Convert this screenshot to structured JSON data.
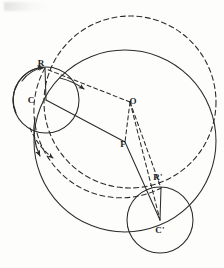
{
  "figure": {
    "background_color": "#fdfdfb",
    "stroke_color": "#2b2b2b",
    "labels": [
      {
        "id": "R",
        "text": "R",
        "x": 41,
        "y": 66,
        "anchor": "middle",
        "role": "point-label"
      },
      {
        "id": "C",
        "text": "C",
        "x": 31,
        "y": 103,
        "anchor": "middle",
        "role": "point-label"
      },
      {
        "id": "O",
        "text": "O",
        "x": 133,
        "y": 104,
        "anchor": "middle",
        "role": "point-label"
      },
      {
        "id": "F",
        "text": "F",
        "x": 123,
        "y": 147,
        "anchor": "middle",
        "role": "point-label"
      },
      {
        "id": "Rp",
        "text": "R'",
        "x": 158,
        "y": 180,
        "anchor": "middle",
        "role": "point-label"
      },
      {
        "id": "Cp",
        "text": "C'",
        "x": 160,
        "y": 233,
        "anchor": "middle",
        "role": "point-label"
      }
    ],
    "points": {
      "R": {
        "x": 45,
        "y": 68
      },
      "C": {
        "x": 46,
        "y": 100
      },
      "O": {
        "x": 130,
        "y": 102
      },
      "F": {
        "x": 125,
        "y": 142
      },
      "Rp": {
        "x": 161,
        "y": 188
      },
      "Cp": {
        "x": 160,
        "y": 220
      }
    },
    "circles": [
      {
        "id": "outer-dashed-circle",
        "cx": 130,
        "cy": 102,
        "r": 86,
        "style": "dashed",
        "label": "large dashed circle centered at O"
      },
      {
        "id": "outer-solid-circle",
        "cx": 125,
        "cy": 141,
        "r": 91,
        "style": "solid",
        "label": "large solid circle centered at F"
      },
      {
        "id": "small-circle-c",
        "cx": 46,
        "cy": 100,
        "r": 33,
        "style": "solid",
        "label": "rolling circle centered at C"
      },
      {
        "id": "small-circle-cprime",
        "cx": 160,
        "cy": 220,
        "r": 33,
        "style": "solid",
        "label": "rolling circle centered at C prime"
      }
    ],
    "segments": [
      {
        "id": "seg-R-C",
        "x1": 45,
        "y1": 68,
        "x2": 46,
        "y2": 100,
        "style": "solid",
        "label": "radius R to C"
      },
      {
        "id": "seg-C-F",
        "x1": 46,
        "y1": 100,
        "x2": 125,
        "y2": 142,
        "style": "solid",
        "label": "segment C to F"
      },
      {
        "id": "seg-O-F",
        "x1": 130,
        "y1": 102,
        "x2": 125,
        "y2": 142,
        "style": "dashed",
        "label": "segment O to F"
      },
      {
        "id": "seg-O-R",
        "x1": 130,
        "y1": 102,
        "x2": 45,
        "y2": 68,
        "style": "dashed",
        "label": "segment O to R"
      },
      {
        "id": "seg-O-Rp",
        "x1": 130,
        "y1": 102,
        "x2": 161,
        "y2": 188,
        "style": "dashed",
        "label": "segment O to R prime"
      },
      {
        "id": "seg-O-Cp",
        "x1": 130,
        "y1": 102,
        "x2": 160,
        "y2": 220,
        "style": "dashed",
        "label": "segment O to C prime"
      },
      {
        "id": "seg-F-Cp",
        "x1": 125,
        "y1": 142,
        "x2": 160,
        "y2": 220,
        "style": "solid",
        "label": "segment F to C prime"
      },
      {
        "id": "seg-Rp-Cp",
        "x1": 161,
        "y1": 188,
        "x2": 160,
        "y2": 220,
        "style": "solid",
        "label": "radius R prime to C prime"
      }
    ],
    "arrow_arcs": [
      {
        "id": "arc-arrow-small-circle-left",
        "label": "rotation arrow on circle C"
      },
      {
        "id": "arc-arrow-dashed-down",
        "label": "direction arrow on dashed path"
      },
      {
        "id": "arc-arrow-inner-dashed",
        "label": "direction arrow on inner dashed arc"
      }
    ]
  }
}
